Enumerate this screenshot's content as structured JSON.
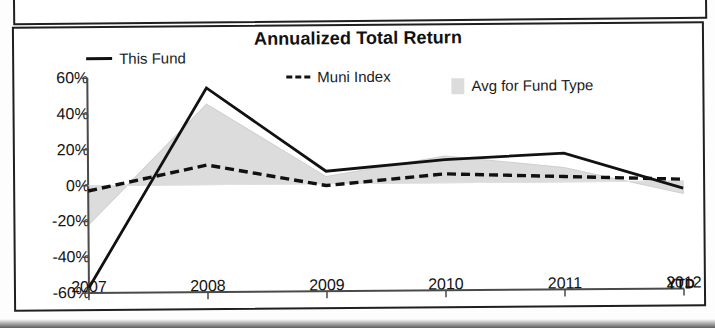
{
  "chart_data": {
    "type": "line",
    "title": "Annualized Total Return",
    "xlabel": "",
    "ylabel": "",
    "categories": [
      "2007",
      "2008",
      "2009",
      "2010",
      "2011",
      "2012"
    ],
    "x_tick_suffix": "YTD",
    "y_ticks": [
      "60%",
      "40%",
      "20%",
      "0%",
      "-20%",
      "-40%",
      "-60%"
    ],
    "y_tick_values": [
      60,
      40,
      20,
      0,
      -20,
      -40,
      -60
    ],
    "ylim": [
      -60,
      60
    ],
    "grid": false,
    "legend_position": "top",
    "series": [
      {
        "name": "This Fund",
        "style": "solid",
        "color": "#111111",
        "values": [
          -57,
          54,
          7,
          13,
          16,
          -4
        ]
      },
      {
        "name": "Muni Index",
        "style": "dashed",
        "color": "#111111",
        "values": [
          -3,
          11,
          -1,
          5,
          3,
          1
        ]
      },
      {
        "name": "Avg for Fund Type",
        "style": "area",
        "color": "#dcdcdc",
        "values": [
          -22,
          45,
          4,
          15,
          8,
          -7
        ]
      }
    ]
  },
  "legend": {
    "items": [
      {
        "label": "This Fund",
        "marker": "solid-line-swatch"
      },
      {
        "label": "Muni Index",
        "marker": "dashed-line-swatch"
      },
      {
        "label": "Avg for Fund Type",
        "marker": "area-swatch"
      }
    ]
  }
}
